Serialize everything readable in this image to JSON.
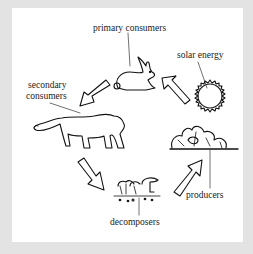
{
  "diagram": {
    "type": "cycle",
    "title": "",
    "background": "#e3e3e3",
    "panel_color": "#ffffff",
    "nodes": [
      {
        "id": "primary_consumers",
        "label": "primary consumers",
        "icon": "rabbit-icon"
      },
      {
        "id": "secondary_consumers",
        "label_line1": "secondary",
        "label_line2": "consumers",
        "icon": "mountain-lion-icon"
      },
      {
        "id": "decomposers",
        "label": "decomposers",
        "icon": "mushrooms-icon"
      },
      {
        "id": "producers",
        "label": "producers",
        "icon": "plants-icon"
      },
      {
        "id": "solar_energy",
        "label": "solar energy",
        "icon": "sun-icon"
      }
    ],
    "edges": [
      {
        "from": "producers",
        "to": "primary_consumers"
      },
      {
        "from": "primary_consumers",
        "to": "secondary_consumers"
      },
      {
        "from": "secondary_consumers",
        "to": "decomposers"
      },
      {
        "from": "decomposers",
        "to": "producers"
      }
    ]
  }
}
